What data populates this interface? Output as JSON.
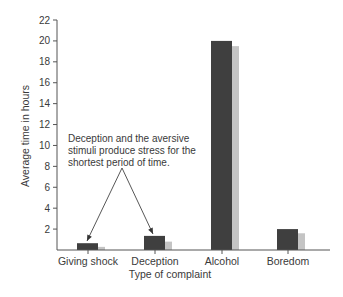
{
  "chart_data": {
    "type": "bar",
    "title": "",
    "xlabel": "Type of complaint",
    "ylabel": "Average time in hours",
    "categories": [
      "Giving shock",
      "Deception",
      "Alcohol",
      "Boredom"
    ],
    "series": [
      {
        "name": "dark",
        "color": "#3f3f3f",
        "values": [
          0.65,
          1.35,
          20,
          2
        ]
      },
      {
        "name": "light",
        "color": "#c4c4c4",
        "values": [
          0.3,
          0.8,
          19.5,
          1.6
        ]
      }
    ],
    "ylim": [
      0,
      22
    ],
    "yticks": [
      2,
      4,
      6,
      8,
      10,
      12,
      14,
      16,
      18,
      20,
      22
    ],
    "grid": false,
    "legend": null,
    "annotation": {
      "lines": [
        "Deception and the aversive",
        "stimuli produce stress for the",
        "shortest period of time."
      ],
      "arrows_to": [
        "Giving shock",
        "Deception"
      ]
    }
  }
}
